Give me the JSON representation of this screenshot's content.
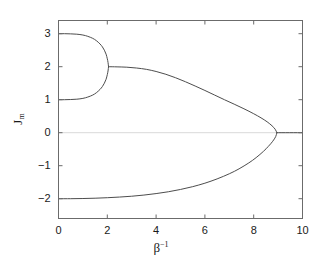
{
  "chart_data": {
    "type": "line",
    "title": "",
    "xlabel": "β⁻¹",
    "ylabel": "J_m",
    "ylabel_base": "J",
    "ylabel_sub": "m",
    "xlim": [
      0,
      10
    ],
    "ylim": [
      -2.6,
      3.4
    ],
    "grid": false,
    "legend": null,
    "xticks": [
      0,
      2,
      4,
      6,
      8,
      10
    ],
    "xtick_labels": [
      "0",
      "2",
      "4",
      "6",
      "8",
      "10"
    ],
    "yticks": [
      -2,
      -1,
      0,
      1,
      2,
      3
    ],
    "ytick_labels": [
      "−2",
      "−1",
      "0",
      "1",
      "2",
      "3"
    ],
    "frame_color": "#6b6b6b",
    "curve_color": "#4d4d4d",
    "zero_line_color": "#d9d9d9",
    "series": [
      {
        "name": "upper-bubble-branch",
        "comment": "upper arc of closed bubble, from (0,3) to pinch at (2.05,2)",
        "points": [
          [
            0.0,
            3.0
          ],
          [
            0.25,
            3.0
          ],
          [
            0.5,
            2.995
          ],
          [
            0.75,
            2.985
          ],
          [
            1.0,
            2.96
          ],
          [
            1.2,
            2.92
          ],
          [
            1.4,
            2.86
          ],
          [
            1.55,
            2.79
          ],
          [
            1.7,
            2.69
          ],
          [
            1.8,
            2.6
          ],
          [
            1.88,
            2.5
          ],
          [
            1.95,
            2.38
          ],
          [
            2.0,
            2.24
          ],
          [
            2.03,
            2.13
          ],
          [
            2.05,
            2.0
          ]
        ]
      },
      {
        "name": "lower-bubble-branch",
        "comment": "lower arc of closed bubble, from (0,1) to pinch at (2.05,2)",
        "points": [
          [
            0.0,
            1.0
          ],
          [
            0.25,
            1.0
          ],
          [
            0.5,
            1.005
          ],
          [
            0.75,
            1.015
          ],
          [
            1.0,
            1.04
          ],
          [
            1.2,
            1.08
          ],
          [
            1.4,
            1.14
          ],
          [
            1.55,
            1.21
          ],
          [
            1.7,
            1.31
          ],
          [
            1.8,
            1.4
          ],
          [
            1.88,
            1.5
          ],
          [
            1.95,
            1.62
          ],
          [
            2.0,
            1.76
          ],
          [
            2.03,
            1.87
          ],
          [
            2.05,
            2.0
          ]
        ]
      },
      {
        "name": "middle-branch",
        "comment": "branch from pinch (2.05,2) sweeping down to fold at (8.95,0)",
        "points": [
          [
            2.05,
            2.0
          ],
          [
            2.4,
            1.995
          ],
          [
            2.8,
            1.985
          ],
          [
            3.2,
            1.96
          ],
          [
            3.6,
            1.92
          ],
          [
            4.0,
            1.855
          ],
          [
            4.4,
            1.77
          ],
          [
            4.8,
            1.665
          ],
          [
            5.2,
            1.545
          ],
          [
            5.6,
            1.415
          ],
          [
            6.0,
            1.28
          ],
          [
            6.4,
            1.14
          ],
          [
            6.8,
            1.0
          ],
          [
            7.2,
            0.865
          ],
          [
            7.6,
            0.725
          ],
          [
            8.0,
            0.575
          ],
          [
            8.3,
            0.45
          ],
          [
            8.55,
            0.33
          ],
          [
            8.75,
            0.21
          ],
          [
            8.88,
            0.105
          ],
          [
            8.95,
            0.0
          ]
        ]
      },
      {
        "name": "bottom-branch",
        "comment": "branch from (0,-2) rising to fold at (8.95,0)",
        "points": [
          [
            0.0,
            -2.0
          ],
          [
            0.5,
            -2.0
          ],
          [
            1.0,
            -1.995
          ],
          [
            1.5,
            -1.985
          ],
          [
            2.0,
            -1.97
          ],
          [
            2.5,
            -1.95
          ],
          [
            3.0,
            -1.925
          ],
          [
            3.5,
            -1.89
          ],
          [
            4.0,
            -1.845
          ],
          [
            4.5,
            -1.79
          ],
          [
            5.0,
            -1.72
          ],
          [
            5.5,
            -1.635
          ],
          [
            6.0,
            -1.53
          ],
          [
            6.5,
            -1.4
          ],
          [
            7.0,
            -1.245
          ],
          [
            7.4,
            -1.095
          ],
          [
            7.8,
            -0.915
          ],
          [
            8.1,
            -0.755
          ],
          [
            8.4,
            -0.565
          ],
          [
            8.6,
            -0.415
          ],
          [
            8.78,
            -0.26
          ],
          [
            8.9,
            -0.12
          ],
          [
            8.95,
            0.0
          ]
        ]
      },
      {
        "name": "zero-branch",
        "comment": "stable zero branch from fold (8.95,0) to (10,0)",
        "points": [
          [
            8.95,
            0.0
          ],
          [
            10.0,
            0.0
          ]
        ]
      }
    ],
    "zero_reference_line": {
      "y": 0,
      "x_from": 0,
      "x_to": 10
    }
  }
}
